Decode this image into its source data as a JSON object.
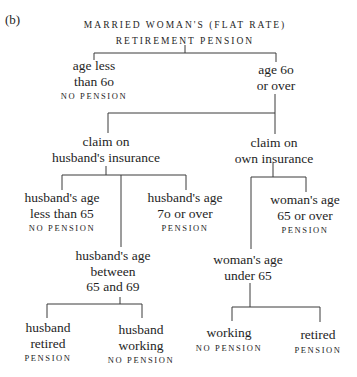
{
  "figure_label": "(b)",
  "root": {
    "title_line1": "MARRIED WOMAN'S (FLAT RATE)",
    "title_line2": "RETIREMENT PENSION"
  },
  "nodes": {
    "age_less_60": {
      "line1": "age less",
      "line2": "than 6o",
      "outcome": "NO PENSION"
    },
    "age_60_over": {
      "line1": "age 6o",
      "line2": "or over"
    },
    "claim_husband": {
      "line1": "claim on",
      "line2": "husband's insurance"
    },
    "claim_own": {
      "line1": "claim on",
      "line2": "own insurance"
    },
    "husband_less_65": {
      "line1": "husband's age",
      "line2": "less than 65",
      "outcome": "NO PENSION"
    },
    "husband_70_over": {
      "line1": "husband's age",
      "line2": "7o or over",
      "outcome": "PENSION"
    },
    "husband_65_69": {
      "line1": "husband's age",
      "line2": "between",
      "line3": "65 and 69"
    },
    "woman_65_over": {
      "line1": "woman's age",
      "line2": "65 or over",
      "outcome": "PENSION"
    },
    "woman_under_65": {
      "line1": "woman's age",
      "line2": "under 65"
    },
    "husband_retired": {
      "line1": "husband",
      "line2": "retired",
      "outcome": "PENSION"
    },
    "husband_working": {
      "line1": "husband",
      "line2": "working",
      "outcome": "NO PENSION"
    },
    "woman_working": {
      "line1": "working",
      "outcome": "NO PENSION"
    },
    "woman_retired": {
      "line1": "retired",
      "outcome": "PENSION"
    }
  },
  "colors": {
    "text": "#1e1e1e",
    "lines": "#3a3a3a",
    "background": "#ffffff"
  }
}
